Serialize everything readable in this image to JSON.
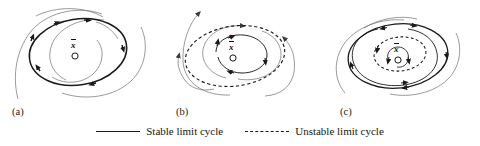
{
  "figure": {
    "background_color": "#ffffff",
    "stroke_color": "#1a1a1a",
    "thin_stroke_color": "#5a5a5a",
    "panels": [
      {
        "id": "a",
        "label": "(a)",
        "fixed_point_symbol": "x",
        "fixed_point_marker": "circle",
        "description": "Stable limit cycle with trajectories spiralling inward and outward onto it",
        "limit_cycles": [
          {
            "kind": "stable",
            "style": "solid",
            "cx": 78,
            "cy": 52,
            "rx": 49,
            "ry": 33,
            "rotation": -9
          }
        ]
      },
      {
        "id": "b",
        "label": "(b)",
        "fixed_point_symbol": "x",
        "fixed_point_marker": "circle",
        "description": "Unstable limit cycle with trajectories spiralling away from it",
        "limit_cycles": [
          {
            "kind": "unstable",
            "style": "dashed",
            "cx": 235,
            "cy": 56,
            "rx": 50,
            "ry": 30,
            "rotation": -8
          }
        ]
      },
      {
        "id": "c",
        "label": "(c)",
        "fixed_point_symbol": "x",
        "fixed_point_marker": "circle",
        "description": "Stable outer limit cycle enclosing an unstable inner limit cycle",
        "limit_cycles": [
          {
            "kind": "stable",
            "style": "solid",
            "cx": 398,
            "cy": 56,
            "rx": 50,
            "ry": 32,
            "rotation": -6
          },
          {
            "kind": "unstable",
            "style": "dashed",
            "cx": 400,
            "cy": 54,
            "rx": 26,
            "ry": 17,
            "rotation": -6
          }
        ]
      }
    ]
  },
  "legend": {
    "items": [
      {
        "label": "Stable limit cycle",
        "line_style": "solid",
        "color": "#1a1a1a"
      },
      {
        "label": "Unstable limit cycle",
        "line_style": "dashed",
        "color": "#1a1a1a"
      }
    ]
  }
}
